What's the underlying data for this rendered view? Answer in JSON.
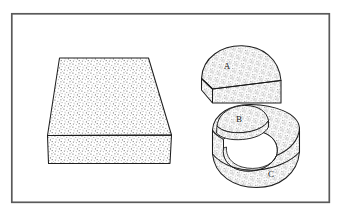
{
  "figure": {
    "background_color": "#ffffff",
    "line_color": "#1a1a1a",
    "stipple_color": "#8c8c8c",
    "frame": {
      "name": "figure-border",
      "x": 11,
      "y": 13,
      "width": 319,
      "height": 190,
      "stroke_width": 1.6,
      "color": "#555555"
    },
    "shapes": [
      {
        "id": "slab",
        "name": "trapezoidal-slab",
        "label": "",
        "faces": [
          "top",
          "front"
        ]
      },
      {
        "id": "half-disc",
        "name": "half-disc-solid",
        "label": "A",
        "label_x": 227,
        "label_y": 68,
        "faces": [
          "top",
          "front"
        ]
      },
      {
        "id": "c-shape",
        "name": "c-shaped-solid",
        "label_inner": "B",
        "label_inner_x": 239,
        "label_inner_y": 128,
        "label_outer": "C",
        "label_outer_x": 270,
        "label_outer_y": 175,
        "faces": [
          "top",
          "front",
          "inner-cut"
        ]
      }
    ],
    "labels": {
      "a": "A",
      "b": "B",
      "c": "C"
    }
  }
}
